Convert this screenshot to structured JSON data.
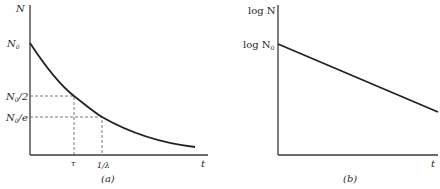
{
  "panels": [
    {
      "id": "a",
      "caption": "(a)",
      "y_axis_label": "N",
      "x_axis_label": "t",
      "y_ticks": [
        {
          "label": "N",
          "sub": "0",
          "suffix": ""
        },
        {
          "label": "N",
          "sub": "0",
          "suffix": "/2"
        },
        {
          "label": "N",
          "sub": "0",
          "suffix": "/e"
        }
      ],
      "x_ticks": [
        "τ",
        "1/λ"
      ],
      "curve": "exponential decay N = N0 e^(-λt)"
    },
    {
      "id": "b",
      "caption": "(b)",
      "y_axis_label": "log N",
      "x_axis_label": "t",
      "y_ticks": [
        {
          "label": "log N",
          "sub": "0"
        }
      ],
      "curve": "straight line decreasing (log N vs t)"
    }
  ],
  "colors": {
    "line": "#222222",
    "axis": "#3a3a3a",
    "dash": "#555555",
    "background": "#ffffff"
  }
}
